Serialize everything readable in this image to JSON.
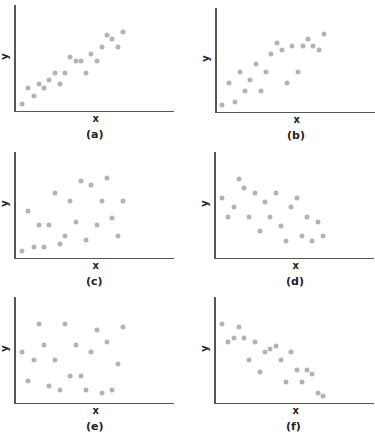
{
  "chart_data": [
    {
      "type": "scatter",
      "title": "(a)",
      "xlabel": "x",
      "ylabel": "y",
      "xlim": [
        0,
        10
      ],
      "ylim": [
        0,
        10
      ],
      "grid": false,
      "legend": false,
      "panel": {
        "left": 14,
        "top": 5,
        "width": 160,
        "height": 107
      },
      "points": [
        [
          0.4,
          0.4
        ],
        [
          1.0,
          2.1
        ],
        [
          1.5,
          1.3
        ],
        [
          2.0,
          2.5
        ],
        [
          2.5,
          2.1
        ],
        [
          3.0,
          2.9
        ],
        [
          3.5,
          3.7
        ],
        [
          4.0,
          2.5
        ],
        [
          4.5,
          3.7
        ],
        [
          5.0,
          5.3
        ],
        [
          5.5,
          4.9
        ],
        [
          6.0,
          4.9
        ],
        [
          6.5,
          3.7
        ],
        [
          7.0,
          5.7
        ],
        [
          7.5,
          4.9
        ],
        [
          8.0,
          6.4
        ],
        [
          8.5,
          7.6
        ],
        [
          9.0,
          7.2
        ],
        [
          9.5,
          6.4
        ],
        [
          10.0,
          8.0
        ]
      ]
    },
    {
      "type": "scatter",
      "title": "(b)",
      "xlabel": "x",
      "ylabel": "y",
      "xlim": [
        0,
        10
      ],
      "ylim": [
        0,
        10
      ],
      "grid": false,
      "legend": false,
      "panel": {
        "left": 215,
        "top": 8,
        "width": 160,
        "height": 105
      },
      "points": [
        [
          0.3,
          0.4
        ],
        [
          1.0,
          2.8
        ],
        [
          1.5,
          0.8
        ],
        [
          2.0,
          4.0
        ],
        [
          2.5,
          1.9
        ],
        [
          3.0,
          3.1
        ],
        [
          3.5,
          4.8
        ],
        [
          4.0,
          1.9
        ],
        [
          4.5,
          4.0
        ],
        [
          5.0,
          5.9
        ],
        [
          5.5,
          7.1
        ],
        [
          6.0,
          6.3
        ],
        [
          6.5,
          2.8
        ],
        [
          7.0,
          6.7
        ],
        [
          7.5,
          4.0
        ],
        [
          8.0,
          6.7
        ],
        [
          8.5,
          7.5
        ],
        [
          9.0,
          6.7
        ],
        [
          9.5,
          6.3
        ],
        [
          10.0,
          8.0
        ]
      ]
    },
    {
      "type": "scatter",
      "title": "(c)",
      "xlabel": "x",
      "ylabel": "y",
      "xlim": [
        0,
        10
      ],
      "ylim": [
        0,
        10
      ],
      "grid": false,
      "legend": false,
      "panel": {
        "left": 14,
        "top": 152,
        "width": 160,
        "height": 107
      },
      "points": [
        [
          0.4,
          0.4
        ],
        [
          1.0,
          4.6
        ],
        [
          1.5,
          0.8
        ],
        [
          2.0,
          3.1
        ],
        [
          2.5,
          0.8
        ],
        [
          3.0,
          3.1
        ],
        [
          3.5,
          6.5
        ],
        [
          4.0,
          1.2
        ],
        [
          4.5,
          2.0
        ],
        [
          5.0,
          5.7
        ],
        [
          5.5,
          3.5
        ],
        [
          6.0,
          7.7
        ],
        [
          6.5,
          1.6
        ],
        [
          7.0,
          7.3
        ],
        [
          7.5,
          3.1
        ],
        [
          8.0,
          5.7
        ],
        [
          8.5,
          8.1
        ],
        [
          9.0,
          3.9
        ],
        [
          9.5,
          2.0
        ],
        [
          10.0,
          5.7
        ]
      ]
    },
    {
      "type": "scatter",
      "title": "(d)",
      "xlabel": "x",
      "ylabel": "y",
      "xlim": [
        0,
        10
      ],
      "ylim": [
        0,
        10
      ],
      "grid": false,
      "legend": false,
      "panel": {
        "left": 214,
        "top": 152,
        "width": 160,
        "height": 107
      },
      "points": [
        [
          0.4,
          6.0
        ],
        [
          1.0,
          4.0
        ],
        [
          1.5,
          5.0
        ],
        [
          2.0,
          8.0
        ],
        [
          2.5,
          7.0
        ],
        [
          3.0,
          4.0
        ],
        [
          3.5,
          6.5
        ],
        [
          4.0,
          2.5
        ],
        [
          4.5,
          5.5
        ],
        [
          5.0,
          4.0
        ],
        [
          5.5,
          6.5
        ],
        [
          6.0,
          3.0
        ],
        [
          6.5,
          1.5
        ],
        [
          7.0,
          5.0
        ],
        [
          7.5,
          6.0
        ],
        [
          8.0,
          2.0
        ],
        [
          8.5,
          4.0
        ],
        [
          9.0,
          1.5
        ],
        [
          9.5,
          3.5
        ],
        [
          10.0,
          2.0
        ]
      ]
    },
    {
      "type": "scatter",
      "title": "(e)",
      "xlabel": "x",
      "ylabel": "y",
      "xlim": [
        0,
        10
      ],
      "ylim": [
        0,
        10
      ],
      "grid": false,
      "legend": false,
      "panel": {
        "left": 14,
        "top": 297,
        "width": 160,
        "height": 107
      },
      "points": [
        [
          0.4,
          5.0
        ],
        [
          1.0,
          2.0
        ],
        [
          1.5,
          4.2
        ],
        [
          2.0,
          8.0
        ],
        [
          2.5,
          5.8
        ],
        [
          3.0,
          1.5
        ],
        [
          3.5,
          4.2
        ],
        [
          4.0,
          1.1
        ],
        [
          4.5,
          8.0
        ],
        [
          5.0,
          2.5
        ],
        [
          5.5,
          5.8
        ],
        [
          6.0,
          2.5
        ],
        [
          6.5,
          1.1
        ],
        [
          7.0,
          5.0
        ],
        [
          7.5,
          7.3
        ],
        [
          8.0,
          0.7
        ],
        [
          8.5,
          6.1
        ],
        [
          9.0,
          1.1
        ],
        [
          9.5,
          3.8
        ],
        [
          10.0,
          7.6
        ]
      ]
    },
    {
      "type": "scatter",
      "title": "(f)",
      "xlabel": "x",
      "ylabel": "y",
      "xlim": [
        0,
        10
      ],
      "ylim": [
        0,
        10
      ],
      "grid": false,
      "legend": false,
      "panel": {
        "left": 214,
        "top": 297,
        "width": 160,
        "height": 107
      },
      "points": [
        [
          0.4,
          8.0
        ],
        [
          1.0,
          6.1
        ],
        [
          1.5,
          6.5
        ],
        [
          2.0,
          7.6
        ],
        [
          2.5,
          6.5
        ],
        [
          3.0,
          4.2
        ],
        [
          3.5,
          6.1
        ],
        [
          4.0,
          2.9
        ],
        [
          4.5,
          5.0
        ],
        [
          5.0,
          5.3
        ],
        [
          5.5,
          5.7
        ],
        [
          6.0,
          4.2
        ],
        [
          6.5,
          1.9
        ],
        [
          7.0,
          5.0
        ],
        [
          7.5,
          3.1
        ],
        [
          8.0,
          1.9
        ],
        [
          8.5,
          3.1
        ],
        [
          9.0,
          2.7
        ],
        [
          9.5,
          0.7
        ],
        [
          10.0,
          0.4
        ]
      ]
    }
  ],
  "labels": {
    "x": "x",
    "y": "y",
    "panels": [
      "(a)",
      "(b)",
      "(c)",
      "(d)",
      "(e)",
      "(f)"
    ]
  },
  "colors": {
    "dot": "#b3b3b3",
    "axis": "#555555",
    "text": "#222222"
  }
}
